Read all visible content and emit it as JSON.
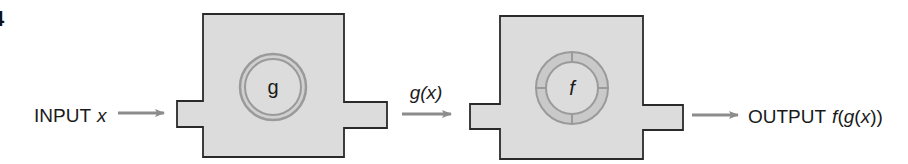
{
  "figure": {
    "number": "4"
  },
  "input": {
    "label_text": "INPUT",
    "variable": "x"
  },
  "machine_g": {
    "name": "g",
    "output_label": "g(x)",
    "output_func": "g",
    "output_arg": "x"
  },
  "machine_f": {
    "name": "f"
  },
  "output": {
    "label_text": "OUTPUT",
    "expression_func": "f",
    "expression_inner_func": "g",
    "expression_arg": "x"
  },
  "colors": {
    "box_fill": "#dcdcdc",
    "box_stroke": "#2a2a2a",
    "ring_fill": "#c9c9c9",
    "ring_stroke": "#9a9a9a",
    "arrow": "#8c8c8c",
    "text": "#1a1a1a"
  }
}
